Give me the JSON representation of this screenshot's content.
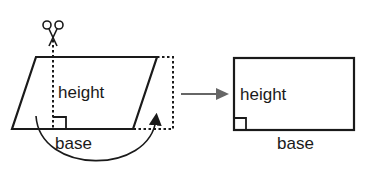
{
  "diagram": {
    "title": "",
    "left_shape": {
      "type": "parallelogram",
      "height_label": "height",
      "base_label": "base"
    },
    "right_shape": {
      "type": "rectangle",
      "height_label": "height",
      "base_label": "base"
    },
    "icons": {
      "scissors": "scissors-icon",
      "transform_arrow": "arrow-right-icon",
      "move_arc": "curved-arrow-icon"
    },
    "colors": {
      "stroke": "#1a1a1a",
      "arrow": "#666666",
      "background": "#ffffff"
    }
  }
}
